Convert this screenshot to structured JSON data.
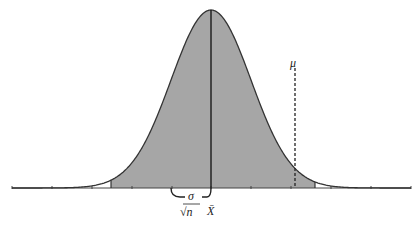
{
  "diagram": {
    "type": "normal-distribution-confidence-interval",
    "curve": {
      "center_x": 211,
      "sigma_px": 40,
      "peak_y": 10,
      "baseline_y": 188,
      "x_start": 12,
      "x_end": 411
    },
    "shaded_region": {
      "x_from": 111,
      "x_to": 315,
      "fill": "#a6a6a6"
    },
    "axis": {
      "ticks_x": [
        12,
        52,
        92,
        132,
        172,
        211,
        251,
        291,
        331,
        371,
        411
      ]
    },
    "labels": {
      "mu": "μ",
      "x_bar": "X̄",
      "sigma": "σ",
      "sqrt_n": "√n"
    },
    "colors": {
      "curve": "#333333",
      "shade": "#a6a6a6",
      "line": "#222222",
      "background": "#ffffff"
    },
    "mu_line": {
      "x": 295,
      "y_top": 68,
      "style": "dashed"
    },
    "xbar_line": {
      "x": 211
    }
  }
}
